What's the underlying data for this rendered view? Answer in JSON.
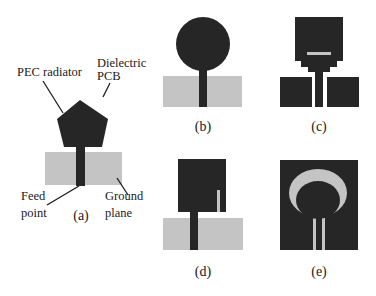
{
  "figure": {
    "colors": {
      "radiator": "#262626",
      "ground_plane": "#c4c4c4",
      "background": "#ffffff",
      "text": "#1a1a1a"
    },
    "panels": [
      {
        "id": "a",
        "caption": "(a)",
        "description": "Pentagon PEC radiator on dielectric PCB with microstrip feed over ground plane",
        "annotations": {
          "pec_radiator": "PEC radiator",
          "dielectric_line1": "Dielectric",
          "dielectric_line2": "PCB",
          "feed_line1": "Feed",
          "feed_line2": "point",
          "ground_line1": "Ground",
          "ground_line2": "plane"
        }
      },
      {
        "id": "b",
        "caption": "(b)",
        "description": "Circular radiator with feed over ground plane"
      },
      {
        "id": "c",
        "caption": "(c)",
        "description": "Stepped rectangular radiator with slot and coplanar ground"
      },
      {
        "id": "d",
        "caption": "(d)",
        "description": "Rectangular radiator with vertical slot over ground plane"
      },
      {
        "id": "e",
        "caption": "(e)",
        "description": "Circular ring slot in dark patch with CPW feed"
      }
    ]
  }
}
